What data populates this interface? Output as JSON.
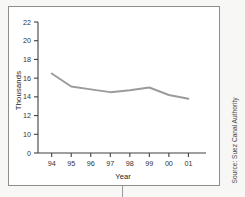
{
  "figure": {
    "source_note": "Source: Suez Canal Authority"
  },
  "chart_data": {
    "type": "line",
    "title": "",
    "xlabel": "Year",
    "ylabel": "Thousands",
    "categories": [
      "94",
      "95",
      "96",
      "97",
      "98",
      "99",
      "00",
      "01"
    ],
    "series": [
      {
        "name": "Transits",
        "values": [
          16.5,
          15.1,
          14.8,
          14.5,
          14.7,
          15.0,
          14.2,
          13.8
        ],
        "color": "#9b9b9b"
      }
    ],
    "x_tick_labels": [
      "94",
      "95",
      "96",
      "97",
      "98",
      "99",
      "00",
      "01"
    ],
    "y_tick_labels": [
      "0",
      "10",
      "12",
      "14",
      "16",
      "18",
      "20",
      "22"
    ],
    "y_tick_values": [
      0,
      10,
      12,
      14,
      16,
      18,
      20,
      22
    ],
    "ylim": [
      0,
      22
    ],
    "axis_break": true,
    "grid": false,
    "legend": false,
    "legend_position": "none"
  }
}
